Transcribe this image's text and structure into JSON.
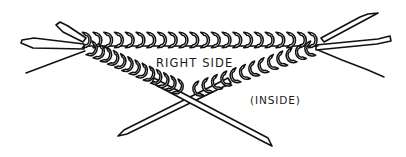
{
  "figure": {
    "background_color": "#ffffff",
    "ink_color": "#111111",
    "width": 406,
    "height": 157
  },
  "labels": {
    "right_side": "RIGHT SIDE",
    "inside": "(INSIDE)"
  },
  "diagram": {
    "top_row_stitch_count": 22,
    "left_diagonal_stitch_count": 13,
    "right_diagonal_stitch_count": 13,
    "needle_tip_count": 6
  }
}
